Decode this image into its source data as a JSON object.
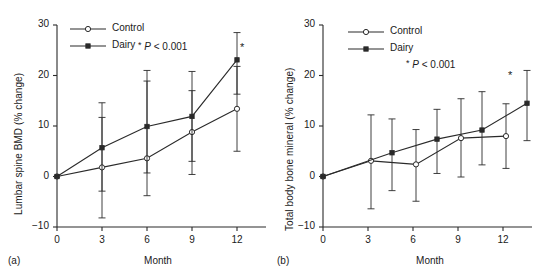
{
  "figure": {
    "panels": [
      {
        "tag": "(a)",
        "ylabel": "Lumbar spine BMD (% change)",
        "xlabel": "Month",
        "pnote_star": "*",
        "pnote_p": "P",
        "pnote_rest": "< 0.001",
        "sig_star": "*",
        "legend": [
          {
            "label": "Control",
            "marker": "open-circle"
          },
          {
            "label": "Dairy",
            "marker": "filled-square"
          }
        ],
        "ytick_labels": [
          "30",
          "20",
          "10",
          "0",
          "−10"
        ],
        "xtick_labels": [
          "0",
          "3",
          "6",
          "9",
          "12"
        ]
      },
      {
        "tag": "(b)",
        "ylabel": "Total body bone mineral (% change)",
        "xlabel": "Month",
        "pnote_star": "*",
        "pnote_p": "P",
        "pnote_rest": "< 0.001",
        "sig_star": "*",
        "legend": [
          {
            "label": "Control",
            "marker": "open-circle"
          },
          {
            "label": "Dairy",
            "marker": "filled-square"
          }
        ],
        "ytick_labels": [
          "30",
          "20",
          "10",
          "0",
          "−10"
        ],
        "xtick_labels": [
          "0",
          "3",
          "6",
          "9",
          "12"
        ]
      }
    ]
  },
  "chart_data": [
    {
      "type": "line",
      "title": "",
      "panel": "(a)",
      "xlabel": "Month",
      "ylabel": "Lumbar spine BMD (% change)",
      "x": [
        0,
        3,
        6,
        9,
        12
      ],
      "xlim": [
        0,
        13
      ],
      "ylim": [
        -10,
        30
      ],
      "yticks": [
        -10,
        0,
        10,
        20,
        30
      ],
      "xticks": [
        0,
        3,
        6,
        9,
        12
      ],
      "grid": false,
      "legend_position": "top-left",
      "annotations": [
        "* P < 0.001"
      ],
      "series": [
        {
          "name": "Control",
          "marker": "open-circle",
          "values": [
            0,
            1.8,
            3.6,
            8.8,
            13.4
          ],
          "err_low": [
            0,
            -8.2,
            -3.8,
            0.4,
            5.0
          ],
          "err_high": [
            0,
            11.7,
            18.9,
            20.8,
            21.8
          ]
        },
        {
          "name": "Dairy",
          "marker": "filled-square",
          "values": [
            0,
            5.7,
            9.9,
            11.9,
            23.1
          ],
          "err_low": [
            0,
            -2.9,
            0.7,
            3.0,
            16.3
          ],
          "err_high": [
            0,
            14.6,
            21.0,
            17.0,
            28.5
          ]
        }
      ]
    },
    {
      "type": "line",
      "title": "",
      "panel": "(b)",
      "xlabel": "Month",
      "ylabel": "Total body bone mineral (% change)",
      "x": [
        0,
        3,
        6,
        9,
        12
      ],
      "xlim": [
        0,
        13
      ],
      "ylim": [
        -10,
        30
      ],
      "yticks": [
        -10,
        0,
        10,
        20,
        30
      ],
      "xticks": [
        0,
        3,
        6,
        9,
        12
      ],
      "grid": false,
      "legend_position": "top-left",
      "annotations": [
        "* P < 0.001"
      ],
      "series": [
        {
          "name": "Control",
          "marker": "open-circle",
          "values": [
            0,
            3.1,
            2.4,
            7.6,
            8.0
          ],
          "err_low": [
            0,
            -6.4,
            -4.9,
            -0.1,
            1.6
          ],
          "err_high": [
            0,
            12.2,
            9.3,
            15.4,
            14.4
          ]
        },
        {
          "name": "Dairy",
          "marker": "filled-square",
          "values": [
            0,
            4.7,
            7.4,
            9.2,
            14.5
          ],
          "err_low": [
            0,
            -2.8,
            0.6,
            2.3,
            7.1
          ],
          "err_high": [
            0,
            11.4,
            13.3,
            16.8,
            21.0
          ]
        }
      ]
    }
  ]
}
